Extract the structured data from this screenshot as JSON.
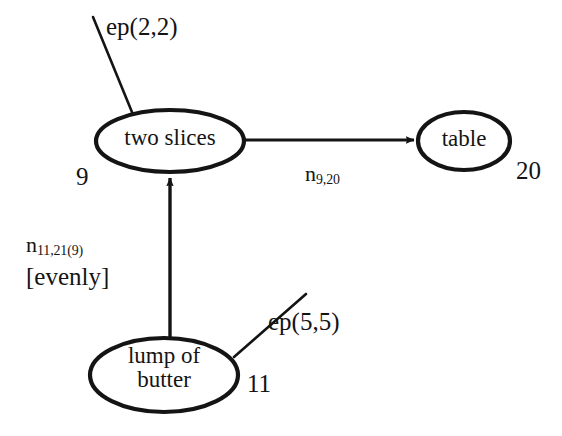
{
  "diagram": {
    "type": "conceptual-graph",
    "background_color": "#ffffff",
    "stroke_color": "#141414",
    "nodes": [
      {
        "id": "two-slices",
        "label": "two slices",
        "identifier": "9",
        "shape": "ellipse",
        "cx": 170,
        "cy": 141,
        "rx": 74,
        "ry": 31
      },
      {
        "id": "table",
        "label": "table",
        "identifier": "20",
        "shape": "ellipse",
        "cx": 464,
        "cy": 141,
        "rx": 46,
        "ry": 29
      },
      {
        "id": "lump-of-butter",
        "label": "lump of\nbutter",
        "identifier": "11",
        "shape": "ellipse",
        "cx": 164,
        "cy": 375,
        "rx": 74,
        "ry": 37
      }
    ],
    "edges": [
      {
        "id": "edge-two-slices-to-table",
        "from": "two-slices",
        "to": "table",
        "arrow": true,
        "direction": "right",
        "label_base": "n",
        "label_subscript": "9,20"
      },
      {
        "id": "edge-lump-to-two-slices",
        "from": "lump-of-butter",
        "to": "two-slices",
        "arrow": true,
        "direction": "up",
        "label_base": "n",
        "label_subscript": "11,21(9)",
        "label_second_line": "[evenly]"
      }
    ],
    "annotations": [
      {
        "id": "ep-two-slices",
        "text": "ep(2,2)",
        "attached_to": "two-slices",
        "leader_line": {
          "x1": 93,
          "y1": 17,
          "x2": 134,
          "y2": 117
        }
      },
      {
        "id": "ep-lump-of-butter",
        "text": "ep(5,5)",
        "attached_to": "lump-of-butter",
        "leader_line": {
          "x1": 306,
          "y1": 294,
          "x2": 234,
          "y2": 357
        }
      }
    ]
  }
}
